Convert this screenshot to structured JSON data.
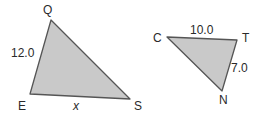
{
  "diagram": {
    "type": "similar-triangles",
    "colors": {
      "fill": "#c9c9c9",
      "stroke": "#555555",
      "text": "#2a2a2a"
    },
    "triangle_qes": {
      "vertices": {
        "Q": {
          "label": "Q",
          "x": 51,
          "y": 20
        },
        "E": {
          "label": "E",
          "x": 30,
          "y": 94
        },
        "S": {
          "label": "S",
          "x": 130,
          "y": 99
        }
      },
      "sides": {
        "QE": "12.0",
        "ES": "x"
      }
    },
    "triangle_ctn": {
      "vertices": {
        "C": {
          "label": "C",
          "x": 167,
          "y": 37
        },
        "T": {
          "label": "T",
          "x": 237,
          "y": 40
        },
        "N": {
          "label": "N",
          "x": 222,
          "y": 91
        }
      },
      "sides": {
        "CT": "10.0",
        "TN": "7.0"
      }
    }
  }
}
